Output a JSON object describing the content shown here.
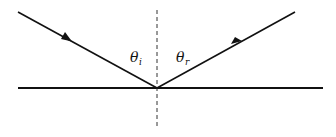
{
  "diagram": {
    "labels": {
      "incident_angle_symbol": "θ",
      "incident_angle_subscript": "i",
      "reflected_angle_symbol": "θ",
      "reflected_angle_subscript": "r"
    },
    "elements": {
      "surface": "reflecting surface",
      "normal": "normal line (dashed)",
      "incident_ray": "incident ray with arrow",
      "reflected_ray": "reflected ray with arrow"
    },
    "colors": {
      "line": "#111111",
      "background": "#ffffff"
    }
  }
}
